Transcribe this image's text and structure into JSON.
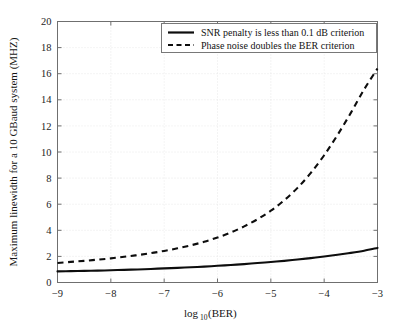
{
  "chart_data": {
    "type": "line",
    "title": "",
    "xlabel": "log10 (BER)",
    "xlabel_main": "log",
    "xlabel_sub": "10",
    "xlabel_tail": " (BER)",
    "ylabel": "Maximum linewidth for a 10 GBaud system (MHZ)",
    "xlim": [
      -9,
      -3
    ],
    "ylim": [
      0,
      20
    ],
    "xticks": [
      -9,
      -8,
      -7,
      -6,
      -5,
      -4,
      -3
    ],
    "xtick_labels": [
      "−9",
      "−8",
      "−7",
      "−6",
      "−5",
      "−4",
      "−3"
    ],
    "yticks": [
      0,
      2,
      4,
      6,
      8,
      10,
      12,
      14,
      16,
      18,
      20
    ],
    "ytick_labels": [
      "0",
      "2",
      "4",
      "6",
      "8",
      "10",
      "12",
      "14",
      "16",
      "18",
      "20"
    ],
    "grid": true,
    "legend_position": "top-right",
    "series": [
      {
        "name": "SNR penalty is less than 0.1 dB criterion",
        "style": "solid",
        "color": "#0d0d0d",
        "x": [
          -9.0,
          -8.75,
          -8.5,
          -8.25,
          -8.0,
          -7.75,
          -7.5,
          -7.25,
          -7.0,
          -6.75,
          -6.5,
          -6.25,
          -6.0,
          -5.75,
          -5.5,
          -5.25,
          -5.0,
          -4.75,
          -4.5,
          -4.25,
          -4.0,
          -3.75,
          -3.5,
          -3.25,
          -3.0
        ],
        "y": [
          0.85,
          0.87,
          0.89,
          0.91,
          0.94,
          0.97,
          1.0,
          1.04,
          1.08,
          1.12,
          1.17,
          1.22,
          1.28,
          1.34,
          1.41,
          1.49,
          1.57,
          1.66,
          1.76,
          1.87,
          1.99,
          2.12,
          2.27,
          2.44,
          2.65
        ]
      },
      {
        "name": "Phase noise doubles the BER criterion",
        "style": "dashed",
        "color": "#0d0d0d",
        "x": [
          -9.0,
          -8.75,
          -8.5,
          -8.25,
          -8.0,
          -7.75,
          -7.5,
          -7.25,
          -7.0,
          -6.75,
          -6.5,
          -6.25,
          -6.0,
          -5.75,
          -5.5,
          -5.25,
          -5.0,
          -4.75,
          -4.5,
          -4.25,
          -4.0,
          -3.75,
          -3.5,
          -3.25,
          -3.0
        ],
        "y": [
          1.5,
          1.58,
          1.66,
          1.75,
          1.85,
          1.97,
          2.1,
          2.25,
          2.42,
          2.62,
          2.85,
          3.12,
          3.45,
          3.83,
          4.3,
          4.85,
          5.5,
          6.3,
          7.25,
          8.4,
          9.75,
          11.3,
          13.0,
          14.8,
          16.4
        ]
      }
    ]
  },
  "legend": {
    "entries": [
      {
        "label": "SNR penalty is less than 0.1 dB criterion",
        "style": "solid"
      },
      {
        "label": "Phase noise doubles the BER criterion",
        "style": "dashed"
      }
    ]
  }
}
